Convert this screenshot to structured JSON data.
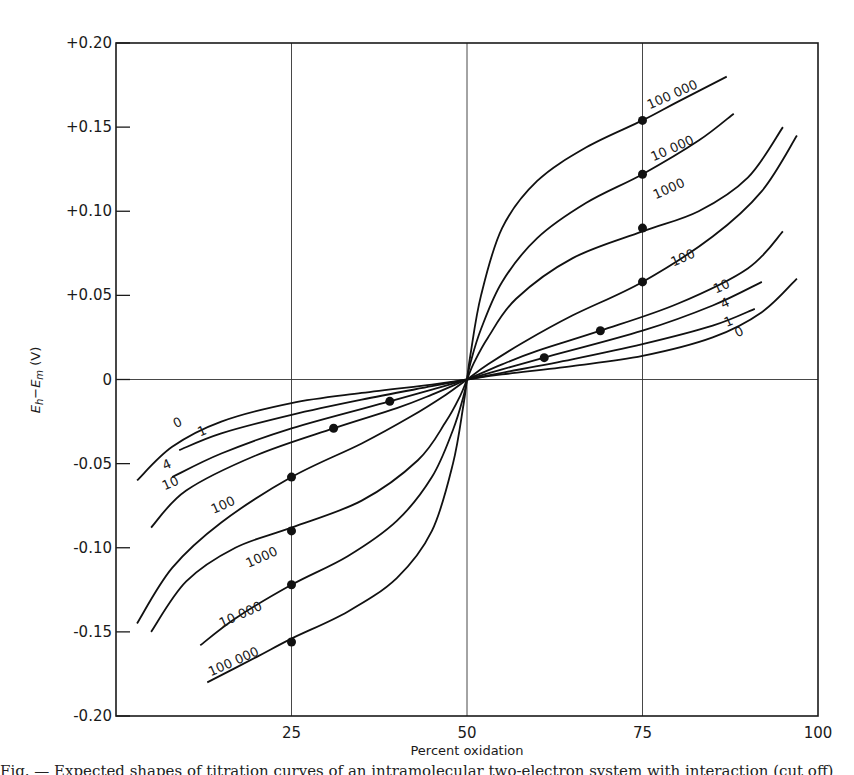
{
  "chart_data": {
    "type": "line",
    "title": "",
    "xlabel": "Percent oxidation",
    "ylabel": "E_h − E_m (V)",
    "xlim": [
      0,
      100
    ],
    "ylim": [
      -0.2,
      0.2
    ],
    "x_ticks": [
      25,
      50,
      75,
      100
    ],
    "x_tick_labels": [
      "25",
      "50",
      "75",
      "100"
    ],
    "y_ticks": [
      0.2,
      0.15,
      0.1,
      0.05,
      0,
      -0.05,
      -0.1,
      -0.15,
      -0.2
    ],
    "y_tick_labels": [
      "+0.20",
      "+0.15",
      "+0.10",
      "+0.05",
      "0",
      "-0.05",
      "-0.10",
      "-0.15",
      "-0.20"
    ],
    "gridlines": {
      "x": [
        25,
        50,
        75
      ],
      "y": [
        0
      ]
    },
    "legend": "inline curve labels",
    "series": [
      {
        "name": "0",
        "K": 0,
        "x": [
          3,
          8,
          15,
          25,
          35,
          45,
          50,
          55,
          65,
          75,
          85,
          92,
          97
        ],
        "y": [
          -0.06,
          -0.04,
          -0.025,
          -0.014,
          -0.008,
          -0.003,
          0,
          0.003,
          0.008,
          0.014,
          0.025,
          0.04,
          0.06
        ],
        "label_pos": {
          "x": 9,
          "y": -0.028
        },
        "label_pos_upper": {
          "x": 89,
          "y": 0.026
        }
      },
      {
        "name": "1",
        "K": 1,
        "x": [
          9,
          15,
          25,
          35,
          45,
          50,
          55,
          65,
          75,
          85,
          91
        ],
        "y": [
          -0.042,
          -0.032,
          -0.021,
          -0.012,
          -0.004,
          0,
          0.004,
          0.012,
          0.021,
          0.032,
          0.042
        ],
        "label_pos": {
          "x": 12.5,
          "y": -0.033
        },
        "label_pos_upper": {
          "x": 87.5,
          "y": 0.032
        }
      },
      {
        "name": "4",
        "K": 4,
        "x": [
          8,
          15,
          25,
          39,
          45,
          50,
          55,
          61,
          75,
          85,
          92
        ],
        "y": [
          -0.058,
          -0.044,
          -0.029,
          -0.013,
          -0.006,
          0,
          0.006,
          0.013,
          0.029,
          0.044,
          0.058
        ],
        "label_pos": {
          "x": 7.5,
          "y": -0.053
        },
        "label_pos_upper": {
          "x": 87,
          "y": 0.043
        },
        "markers": [
          {
            "x": 39,
            "y": -0.013
          },
          {
            "x": 61,
            "y": 0.013
          }
        ]
      },
      {
        "name": "10",
        "K": 10,
        "x": [
          5,
          10,
          20,
          31,
          40,
          45,
          50,
          55,
          60,
          69,
          80,
          90,
          95
        ],
        "y": [
          -0.088,
          -0.066,
          -0.045,
          -0.029,
          -0.017,
          -0.009,
          0,
          0.009,
          0.017,
          0.029,
          0.045,
          0.066,
          0.088
        ],
        "label_pos": {
          "x": 8,
          "y": -0.064
        },
        "label_pos_upper": {
          "x": 86.5,
          "y": 0.053
        },
        "markers": [
          {
            "x": 31,
            "y": -0.029
          },
          {
            "x": 69,
            "y": 0.029
          }
        ]
      },
      {
        "name": "100",
        "K": 100,
        "x": [
          3,
          8,
          15,
          25,
          35,
          42,
          47,
          50,
          53,
          58,
          65,
          75,
          85,
          92,
          97
        ],
        "y": [
          -0.145,
          -0.112,
          -0.085,
          -0.058,
          -0.038,
          -0.022,
          -0.009,
          0,
          0.009,
          0.022,
          0.038,
          0.058,
          0.085,
          0.112,
          0.145
        ],
        "label_pos": {
          "x": 15.5,
          "y": -0.077
        },
        "label_pos_upper": {
          "x": 81,
          "y": 0.07
        },
        "markers": [
          {
            "x": 25,
            "y": -0.058
          },
          {
            "x": 75,
            "y": 0.058
          }
        ]
      },
      {
        "name": "1000",
        "K": 1000,
        "x": [
          5,
          10,
          17,
          25,
          35,
          43,
          47,
          49,
          50,
          51,
          53,
          57,
          65,
          75,
          83,
          90,
          95
        ],
        "y": [
          -0.15,
          -0.12,
          -0.1,
          -0.088,
          -0.072,
          -0.048,
          -0.025,
          -0.01,
          0,
          0.01,
          0.025,
          0.048,
          0.072,
          0.088,
          0.1,
          0.12,
          0.15
        ],
        "label_pos": {
          "x": 21,
          "y": -0.108
        },
        "label_pos_upper": {
          "x": 79,
          "y": 0.111
        },
        "markers": [
          {
            "x": 25,
            "y": -0.09
          },
          {
            "x": 75,
            "y": 0.09
          }
        ]
      },
      {
        "name": "10 000",
        "K": 10000,
        "x": [
          12,
          17,
          25,
          33,
          40,
          45,
          48,
          49.5,
          50,
          50.5,
          52,
          55,
          60,
          67,
          75,
          83,
          88
        ],
        "y": [
          -0.158,
          -0.142,
          -0.122,
          -0.105,
          -0.084,
          -0.058,
          -0.03,
          -0.01,
          0,
          0.01,
          0.03,
          0.058,
          0.084,
          0.105,
          0.122,
          0.142,
          0.158
        ],
        "label_pos": {
          "x": 18,
          "y": -0.142
        },
        "label_pos_upper": {
          "x": 79.5,
          "y": 0.135
        },
        "markers": [
          {
            "x": 25,
            "y": -0.122
          },
          {
            "x": 75,
            "y": 0.122
          }
        ]
      },
      {
        "name": "100 000",
        "K": 100000,
        "x": [
          13,
          20,
          25,
          33,
          40,
          45,
          48,
          49.5,
          50,
          50.5,
          52,
          55,
          60,
          67,
          75,
          80,
          87
        ],
        "y": [
          -0.18,
          -0.165,
          -0.154,
          -0.138,
          -0.118,
          -0.09,
          -0.05,
          -0.015,
          0,
          0.015,
          0.05,
          0.09,
          0.118,
          0.138,
          0.154,
          0.165,
          0.18
        ],
        "label_pos": {
          "x": 17,
          "y": -0.17
        },
        "label_pos_upper": {
          "x": 79.5,
          "y": 0.167
        },
        "markers": [
          {
            "x": 25,
            "y": -0.156
          },
          {
            "x": 75,
            "y": 0.154
          }
        ]
      }
    ]
  },
  "axes": {
    "xlabel": "Percent oxidation",
    "ylabel_main": "E",
    "ylabel_sub1": "h",
    "ylabel_mid": "−E",
    "ylabel_sub2": "m",
    "ylabel_unit": " (V)"
  },
  "caption": "Fig. — Expected shapes of titration curves of an intramolecular two-electron system with interaction (cut off)"
}
